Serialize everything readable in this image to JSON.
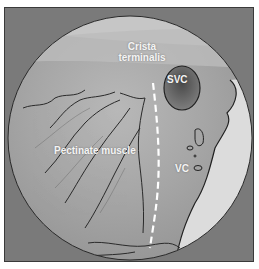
{
  "figure": {
    "type": "endoscopic-anatomy-image",
    "labels": {
      "crista_line1": "Crista",
      "crista_line2": "terminalis",
      "svc": "SVC",
      "vc": "VC",
      "pectinate": "Pectinate muscle"
    },
    "colors": {
      "background": "#7a7a7a",
      "tissue_light": "#cfcfcf",
      "tissue_mid": "#a9a9a9",
      "tissue_dark": "#8a8a8a",
      "outline": "#2a2a2a",
      "dashed_line": "#ffffff",
      "label_text": "#f4f4f4"
    }
  }
}
